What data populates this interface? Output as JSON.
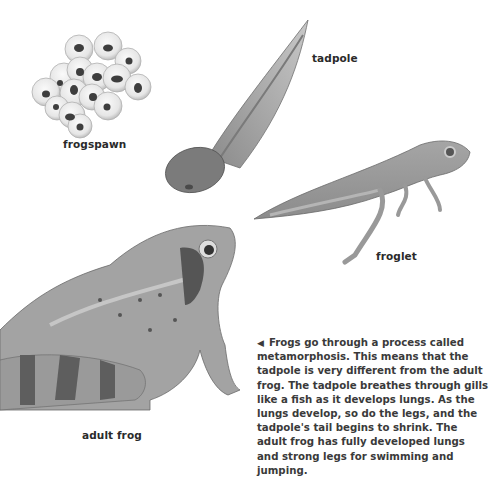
{
  "figure": {
    "labels": {
      "frogspawn": "frogspawn",
      "tadpole": "tadpole",
      "froglet": "froglet",
      "adult_frog": "adult frog"
    },
    "caption": {
      "pointer_icon": "left-triangle",
      "text": "Frogs go through a process called metamorphosis. This means that the tadpole is very different from the adult frog. The tadpole breathes through gills like a fish as it develops lungs. As the lungs develop, so do the legs, and the tadpole's tail begins to shrink. The adult frog has fully developed lungs and strong legs for swimming and jumping."
    }
  }
}
